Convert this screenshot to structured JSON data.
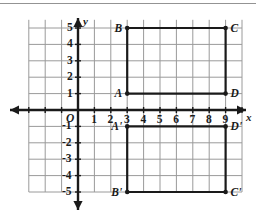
{
  "figure": {
    "type": "coordinate-plane",
    "title": "",
    "axis_labels": {
      "x": "x",
      "y": "y",
      "origin": "O"
    },
    "x_ticks": [
      "1",
      "2",
      "3",
      "4",
      "5",
      "6",
      "7",
      "8",
      "9"
    ],
    "y_ticks_positive": [
      "1",
      "2",
      "3",
      "4",
      "5"
    ],
    "y_ticks_negative": [
      "-1",
      "-2",
      "-3",
      "-4",
      "-5"
    ],
    "colors": {
      "grid": "#9a9a9a",
      "axis": "#1a1a1a",
      "shape": "#1a1a1a",
      "background": "#ffffff",
      "rule": "#6f6f6f"
    },
    "geometry": {
      "grid_spacing_px": 16.4,
      "origin_px": {
        "x": 78,
        "y": 110
      },
      "x_range": [
        -3,
        10
      ],
      "y_range": [
        -5,
        5.5
      ]
    },
    "shapes": [
      {
        "name": "rectangle-ABCD",
        "vertices": [
          {
            "label": "A",
            "x": 3,
            "y": 1,
            "label_side": "left"
          },
          {
            "label": "B",
            "x": 3,
            "y": 5,
            "label_side": "left"
          },
          {
            "label": "C",
            "x": 9,
            "y": 5,
            "label_side": "right"
          },
          {
            "label": "D",
            "x": 9,
            "y": 1,
            "label_side": "right"
          }
        ]
      },
      {
        "name": "rectangle-A-prime-B-prime-C-prime-D-prime",
        "vertices": [
          {
            "label": "A'",
            "x": 3,
            "y": -1,
            "label_side": "left"
          },
          {
            "label": "B'",
            "x": 3,
            "y": -5,
            "label_side": "left"
          },
          {
            "label": "C'",
            "x": 9,
            "y": -5,
            "label_side": "right"
          },
          {
            "label": "D'",
            "x": 9,
            "y": -1,
            "label_side": "right"
          }
        ]
      }
    ]
  },
  "chart_data": {
    "type": "scatter",
    "title": "",
    "xlabel": "x",
    "ylabel": "y",
    "xlim": [
      -3,
      10
    ],
    "ylim": [
      -5,
      5.5
    ],
    "grid": true,
    "legend": "none",
    "series": [
      {
        "name": "Rectangle ABCD",
        "points": [
          {
            "label": "A",
            "x": 3,
            "y": 1
          },
          {
            "label": "B",
            "x": 3,
            "y": 5
          },
          {
            "label": "C",
            "x": 9,
            "y": 5
          },
          {
            "label": "D",
            "x": 9,
            "y": 1
          }
        ],
        "closed": true
      },
      {
        "name": "Rectangle A'B'C'D'",
        "points": [
          {
            "label": "A'",
            "x": 3,
            "y": -1
          },
          {
            "label": "B'",
            "x": 3,
            "y": -5
          },
          {
            "label": "C'",
            "x": 9,
            "y": -5
          },
          {
            "label": "D'",
            "x": 9,
            "y": -1
          }
        ],
        "closed": true
      }
    ],
    "xticks": [
      1,
      2,
      3,
      4,
      5,
      6,
      7,
      8,
      9
    ],
    "yticks": [
      -5,
      -4,
      -3,
      -2,
      -1,
      1,
      2,
      3,
      4,
      5
    ]
  }
}
